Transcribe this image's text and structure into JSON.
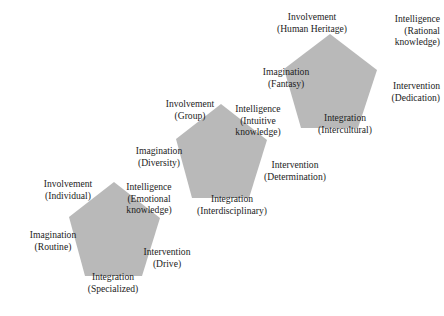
{
  "figure": {
    "background_color": "#ffffff",
    "pentagon_fill": "#b9b9b9",
    "text_color": "#1c1c1c"
  },
  "pentagons": [
    {
      "id": "pentagon-top-right",
      "name": "human-heritage-pentagon",
      "points": "330,34 377,70 358,128 301,128 284,69",
      "labels": [
        {
          "name": "involvement-human-heritage",
          "lines": [
            "Involvement",
            "(Human Heritage)"
          ],
          "align": "center",
          "anchor": "center",
          "x": 312,
          "y": 11
        },
        {
          "name": "intelligence-rational-knowledge",
          "lines": [
            "Intelligence",
            "(Rational",
            "knowledge)"
          ],
          "align": "right",
          "anchor": "right",
          "x": 440,
          "y": 13
        },
        {
          "name": "intervention-dedication",
          "lines": [
            "Intervention",
            "(Dedication)"
          ],
          "align": "right",
          "anchor": "right",
          "x": 440,
          "y": 80
        },
        {
          "name": "integration-intercultural",
          "lines": [
            "Integration",
            "(Intercultural)"
          ],
          "align": "center",
          "anchor": "center",
          "x": 345,
          "y": 112
        },
        {
          "name": "imagination-fantasy",
          "lines": [
            "Imagination",
            "(Fantasy)"
          ],
          "align": "center",
          "anchor": "center",
          "x": 286,
          "y": 66
        }
      ]
    },
    {
      "id": "pentagon-middle",
      "name": "group-pentagon",
      "points": "221,104 267,140 249,198 192,198 176,139",
      "labels": [
        {
          "name": "involvement-group",
          "lines": [
            "Involvement",
            "(Group)"
          ],
          "align": "center",
          "anchor": "center",
          "x": 190,
          "y": 98
        },
        {
          "name": "intelligence-intuitive-knowledge",
          "lines": [
            "Intelligence",
            "(Intuitive",
            "knowledge)"
          ],
          "align": "center",
          "anchor": "center",
          "x": 258,
          "y": 103
        },
        {
          "name": "intervention-determination",
          "lines": [
            "Intervention",
            "(Determination)"
          ],
          "align": "center",
          "anchor": "center",
          "x": 295,
          "y": 159
        },
        {
          "name": "integration-interdisciplinary",
          "lines": [
            "Integration",
            "(Interdisciplinary)"
          ],
          "align": "center",
          "anchor": "center",
          "x": 232,
          "y": 193
        },
        {
          "name": "imagination-diversity",
          "lines": [
            "Imagination",
            "(Diversity)"
          ],
          "align": "center",
          "anchor": "center",
          "x": 159,
          "y": 145
        }
      ]
    },
    {
      "id": "pentagon-bottom-left",
      "name": "individual-pentagon",
      "points": "114,182 160,218 142,276 85,276 69,217",
      "labels": [
        {
          "name": "involvement-individual",
          "lines": [
            "Involvement",
            "(Individual)"
          ],
          "align": "center",
          "anchor": "center",
          "x": 68,
          "y": 178
        },
        {
          "name": "intelligence-emotional-knowledge",
          "lines": [
            "Intelligence",
            "(Emotional",
            "knowledge)"
          ],
          "align": "center",
          "anchor": "center",
          "x": 149,
          "y": 181
        },
        {
          "name": "intervention-drive",
          "lines": [
            "Intervention",
            "(Drive)"
          ],
          "align": "center",
          "anchor": "center",
          "x": 167,
          "y": 246
        },
        {
          "name": "integration-specialized",
          "lines": [
            "Integration",
            "(Specialized)"
          ],
          "align": "center",
          "anchor": "center",
          "x": 113,
          "y": 271
        },
        {
          "name": "imagination-routine",
          "lines": [
            "Imagination",
            "(Routine)"
          ],
          "align": "center",
          "anchor": "center",
          "x": 53,
          "y": 229
        }
      ]
    }
  ]
}
